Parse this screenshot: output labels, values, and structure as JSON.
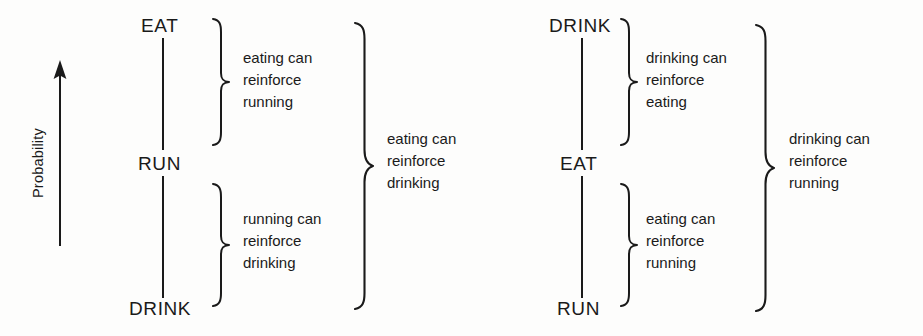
{
  "figure": {
    "axis": {
      "label": "Probability",
      "icon": "up-arrow-icon",
      "direction": "up"
    },
    "ink_color": "#1a1a1a",
    "background_color": "#fdfdfc",
    "panels": [
      {
        "id": "left-panel",
        "name": "eat-run-drink-hierarchy",
        "nodes": [
          {
            "id": "node-top",
            "label": "EAT"
          },
          {
            "id": "node-middle",
            "label": "RUN"
          },
          {
            "id": "node-bottom",
            "label": "DRINK"
          }
        ],
        "inner_annotations": [
          {
            "id": "upper-pair",
            "lines": [
              "eating can",
              "reinforce",
              "running"
            ],
            "text": "eating can reinforce running"
          },
          {
            "id": "lower-pair",
            "lines": [
              "running can",
              "reinforce",
              "drinking"
            ],
            "text": "running can reinforce drinking"
          }
        ],
        "outer_annotation": {
          "id": "span-pair",
          "lines": [
            "eating can",
            "reinforce",
            "drinking"
          ],
          "text": "eating can reinforce drinking"
        }
      },
      {
        "id": "right-panel",
        "name": "drink-eat-run-hierarchy",
        "nodes": [
          {
            "id": "node-top",
            "label": "DRINK"
          },
          {
            "id": "node-middle",
            "label": "EAT"
          },
          {
            "id": "node-bottom",
            "label": "RUN"
          }
        ],
        "inner_annotations": [
          {
            "id": "upper-pair",
            "lines": [
              "drinking can",
              "reinforce",
              "eating"
            ],
            "text": "drinking can reinforce eating"
          },
          {
            "id": "lower-pair",
            "lines": [
              "eating can",
              "reinforce",
              "running"
            ],
            "text": "eating can reinforce running"
          }
        ],
        "outer_annotation": {
          "id": "span-pair",
          "lines": [
            "drinking can",
            "reinforce",
            "running"
          ],
          "text": "drinking can reinforce running"
        }
      }
    ]
  }
}
